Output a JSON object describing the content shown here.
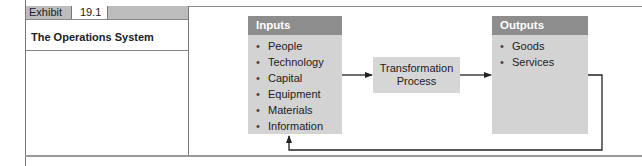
{
  "exhibit": {
    "label": "Exhibit",
    "number": "19.1",
    "title": "The Operations System"
  },
  "diagram": {
    "inputs": {
      "heading": "Inputs",
      "items": [
        "People",
        "Technology",
        "Capital",
        "Equipment",
        "Materials",
        "Information"
      ]
    },
    "transformation": {
      "line1": "Transformation",
      "line2": "Process"
    },
    "outputs": {
      "heading": "Outputs",
      "items": [
        "Goods",
        "Services"
      ]
    },
    "bullet_glyph": "•",
    "colors": {
      "box_fill": "#d3d3d3",
      "box_header": "#8d8d8d",
      "exhibit_bar": "#bdbdbd",
      "arrow": "#222222"
    }
  }
}
